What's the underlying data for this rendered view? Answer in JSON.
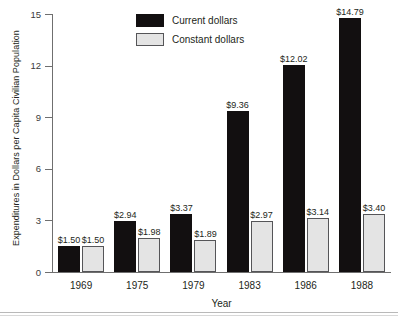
{
  "chart_data": {
    "type": "bar",
    "title": "",
    "xlabel": "Year",
    "ylabel": "Expenditures in Dollars per Capita Civilian Population",
    "categories": [
      "1969",
      "1975",
      "1979",
      "1983",
      "1986",
      "1988"
    ],
    "series": [
      {
        "name": "Current dollars",
        "color": "#120f10",
        "values": [
          1.5,
          2.94,
          3.37,
          9.36,
          12.02,
          14.79
        ],
        "labels": [
          "$1.50",
          "$2.94",
          "$3.37",
          "$9.36",
          "$12.02",
          "$14.79"
        ]
      },
      {
        "name": "Constant dollars",
        "color": "#e4e4e4",
        "values": [
          1.5,
          1.98,
          1.89,
          2.97,
          3.14,
          3.4
        ],
        "labels": [
          "$1.50",
          "$1.98",
          "$1.89",
          "$2.97",
          "$3.14",
          "$3.40"
        ]
      }
    ],
    "ylim": [
      0,
      15
    ],
    "yticks": [
      0,
      3,
      6,
      9,
      12,
      15
    ],
    "ytick_labels": [
      "0",
      "3",
      "6",
      "9",
      "12",
      "15"
    ],
    "grid": false,
    "legend_position": "top-center-left"
  },
  "legend": {
    "items": [
      {
        "label": "Current dollars",
        "swatch": "current"
      },
      {
        "label": "Constant dollars",
        "swatch": "constant"
      }
    ]
  },
  "axes": {
    "y_title": "Expenditures in Dollars per Capita Civilian Population",
    "x_title": "Year"
  }
}
